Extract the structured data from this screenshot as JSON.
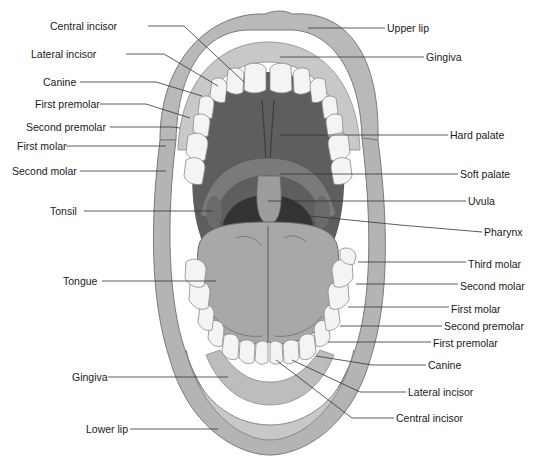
{
  "diagram": {
    "colors": {
      "background": "#ffffff",
      "lip": "#b9b9b9",
      "lip_highlight": "#d6d6d6",
      "gingiva": "#c4c4c4",
      "teeth": "#f4f4f4",
      "teeth_outline": "#8a8a8a",
      "hard_palate": "#5e5e5e",
      "soft_palate": "#7a7a7a",
      "uvula": "#9a9a9a",
      "pharynx": "#3a3a3a",
      "tongue": "#a8a8a8",
      "leader_line": "#333333",
      "label_text": "#1a1a1a"
    },
    "labels_left": [
      {
        "id": "central-incisor-upper",
        "text": "Central incisor",
        "x": 50,
        "y": 20
      },
      {
        "id": "lateral-incisor-upper",
        "text": "Lateral incisor",
        "x": 31,
        "y": 48
      },
      {
        "id": "canine-upper",
        "text": "Canine",
        "x": 43,
        "y": 76
      },
      {
        "id": "first-premolar-upper",
        "text": "First premolar",
        "x": 35,
        "y": 98
      },
      {
        "id": "second-premolar-upper",
        "text": "Second premolar",
        "x": 26,
        "y": 121
      },
      {
        "id": "first-molar-upper",
        "text": "First molar",
        "x": 17,
        "y": 140
      },
      {
        "id": "second-molar-upper",
        "text": "Second molar",
        "x": 12,
        "y": 165
      },
      {
        "id": "tonsil",
        "text": "Tonsil",
        "x": 50,
        "y": 205
      },
      {
        "id": "tongue",
        "text": "Tongue",
        "x": 63,
        "y": 275
      },
      {
        "id": "gingiva-lower",
        "text": "Gingiva",
        "x": 72,
        "y": 371
      },
      {
        "id": "lower-lip",
        "text": "Lower lip",
        "x": 86,
        "y": 423
      }
    ],
    "labels_right": [
      {
        "id": "upper-lip",
        "text": "Upper lip",
        "x": 387,
        "y": 22
      },
      {
        "id": "gingiva-upper",
        "text": "Gingiva",
        "x": 426,
        "y": 51
      },
      {
        "id": "hard-palate",
        "text": "Hard palate",
        "x": 450,
        "y": 129
      },
      {
        "id": "soft-palate",
        "text": "Soft palate",
        "x": 460,
        "y": 168
      },
      {
        "id": "uvula",
        "text": "Uvula",
        "x": 468,
        "y": 195
      },
      {
        "id": "pharynx",
        "text": "Pharynx",
        "x": 484,
        "y": 226
      },
      {
        "id": "third-molar-lower",
        "text": "Third molar",
        "x": 468,
        "y": 258
      },
      {
        "id": "second-molar-lower",
        "text": "Second molar",
        "x": 460,
        "y": 280
      },
      {
        "id": "first-molar-lower",
        "text": "First molar",
        "x": 451,
        "y": 303
      },
      {
        "id": "second-premolar-lower",
        "text": "Second premolar",
        "x": 444,
        "y": 320
      },
      {
        "id": "first-premolar-lower",
        "text": "First premolar",
        "x": 433,
        "y": 337
      },
      {
        "id": "canine-lower",
        "text": "Canine",
        "x": 428,
        "y": 359
      },
      {
        "id": "lateral-incisor-lower",
        "text": "Lateral incisor",
        "x": 408,
        "y": 386
      },
      {
        "id": "central-incisor-lower",
        "text": "Central incisor",
        "x": 396,
        "y": 412
      }
    ]
  }
}
